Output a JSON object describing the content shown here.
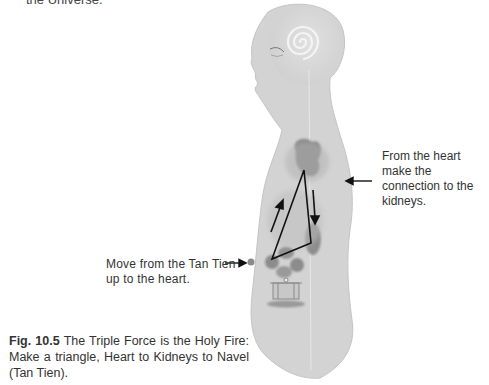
{
  "top_fragment": "the Universe.",
  "annotations": {
    "heart_to_kidneys": "From the heart make the connection to the kidneys.",
    "tan_tien_to_heart": "Move from the Tan Tien up to the heart."
  },
  "caption": {
    "figure_number": "Fig. 10.5",
    "text": " The Triple Force is the Holy Fire: Make a triangle, Heart to Kidneys to Navel (Tan Tien)."
  },
  "colors": {
    "body_fill": "#d4d4d4",
    "organ_fill": "#8c8c8c",
    "line": "#111111",
    "spiral": "#f2f2f2"
  }
}
